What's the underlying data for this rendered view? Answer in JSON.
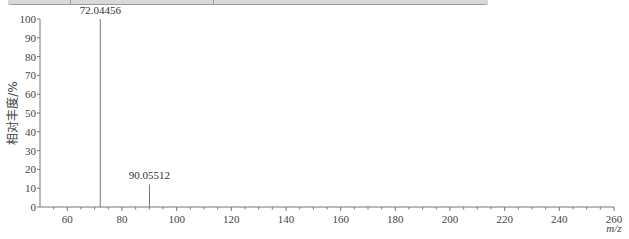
{
  "chart_data": {
    "type": "bar",
    "subtype": "mass-spectrum",
    "title": "",
    "xlabel": "m/z",
    "ylabel": "相对丰度/%",
    "xlim": [
      50,
      260
    ],
    "ylim": [
      0,
      100
    ],
    "x_ticks": [
      60,
      80,
      100,
      120,
      140,
      160,
      180,
      200,
      220,
      240,
      260
    ],
    "y_ticks": [
      0,
      10,
      20,
      30,
      40,
      50,
      60,
      70,
      80,
      90,
      100
    ],
    "grid": false,
    "legend": null,
    "peaks": [
      {
        "mz": 72.04456,
        "abundance": 100,
        "label": "72.04456"
      },
      {
        "mz": 90.05512,
        "abundance": 12,
        "label": "90.05512"
      }
    ]
  },
  "labels": {
    "ylabel": "相对丰度/%",
    "xlabel": "m/z"
  }
}
